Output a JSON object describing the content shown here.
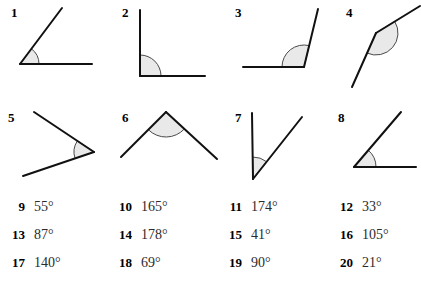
{
  "page": {
    "background_color": "#ffffff",
    "line_color": "#111111",
    "arc_fill_color": "#e9e9e9",
    "arc_stroke_color": "#4a4a4a"
  },
  "figures": [
    {
      "label": "1",
      "name": "angle-figure-1",
      "vertex": [
        20,
        64
      ],
      "ray_a_end": [
        92,
        64
      ],
      "ray_b_end": [
        62,
        8
      ],
      "arc_radius": 19,
      "arc_type": "single",
      "description": "acute angle opening up-right from horizontal base"
    },
    {
      "label": "2",
      "name": "angle-figure-2",
      "vertex": [
        140,
        76
      ],
      "ray_a_end": [
        205,
        76
      ],
      "ray_b_end": [
        140,
        10
      ],
      "arc_radius": 21,
      "arc_type": "single",
      "description": "right angle between vertical and horizontal rays"
    },
    {
      "label": "3",
      "name": "angle-figure-3",
      "vertex": [
        304,
        67
      ],
      "ray_a_end": [
        243,
        67
      ],
      "ray_b_end": [
        318,
        9
      ],
      "arc_radius": 22,
      "arc_type": "single",
      "description": "obtuse angle between horizontal left ray and steep up-right ray"
    },
    {
      "label": "4",
      "name": "angle-figure-4",
      "vertex": [
        376,
        33
      ],
      "ray_a_end": [
        420,
        6
      ],
      "ray_b_end": [
        352,
        87
      ],
      "arc_radius": 22,
      "arc_type": "single",
      "description": "nearly straight angle, almost collinear rays"
    },
    {
      "label": "5",
      "name": "angle-figure-5",
      "vertex": [
        94,
        152
      ],
      "ray_a_end": [
        34,
        112
      ],
      "ray_b_end": [
        23,
        176
      ],
      "arc_radius": 20,
      "arc_type": "single",
      "description": "narrow acute angle opening to the left"
    },
    {
      "label": "6",
      "name": "angle-figure-6",
      "vertex": [
        166,
        112
      ],
      "ray_a_end": [
        121,
        157
      ],
      "ray_b_end": [
        217,
        159
      ],
      "arc_radius": 25,
      "arc_type": "single",
      "description": "obtuse angle opening downward, apex at top"
    },
    {
      "label": "7",
      "name": "angle-figure-7",
      "vertex": [
        253,
        179
      ],
      "ray_a_end": [
        252,
        113
      ],
      "ray_b_end": [
        302,
        117
      ],
      "arc_radius": 22,
      "arc_type": "single",
      "description": "acute angle between vertical ray and up-right ray"
    },
    {
      "label": "8",
      "name": "angle-figure-8",
      "vertex": [
        354,
        167
      ],
      "ray_a_end": [
        416,
        167
      ],
      "ray_b_end": [
        401,
        112
      ],
      "arc_radius": 22,
      "arc_type": "single",
      "description": "acute angle above horizontal base"
    }
  ],
  "answers": {
    "rows": [
      [
        {
          "number": "9",
          "value": "55°"
        },
        {
          "number": "10",
          "value": "165°"
        },
        {
          "number": "11",
          "value": "174°"
        },
        {
          "number": "12",
          "value": "33°"
        }
      ],
      [
        {
          "number": "13",
          "value": "87°"
        },
        {
          "number": "14",
          "value": "178°"
        },
        {
          "number": "15",
          "value": "41°"
        },
        {
          "number": "16",
          "value": "105°"
        }
      ],
      [
        {
          "number": "17",
          "value": "140°"
        },
        {
          "number": "18",
          "value": "69°"
        },
        {
          "number": "19",
          "value": "90°"
        },
        {
          "number": "20",
          "value": "21°"
        }
      ]
    ]
  }
}
